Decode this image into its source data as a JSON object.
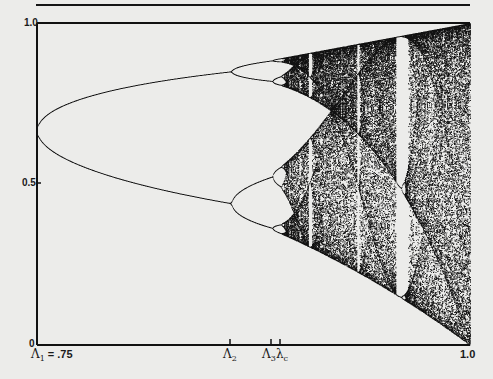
{
  "chart_data": {
    "type": "scatter",
    "title": "",
    "subtitle": "Bifurcation diagram (period-doubling cascade to chaos)",
    "xlabel": "",
    "ylabel": "",
    "xlim": [
      0.75,
      1.0
    ],
    "ylim": [
      0,
      1.0
    ],
    "grid": false,
    "legend": null,
    "y_ticks": [
      {
        "value": 0,
        "label": "0"
      },
      {
        "value": 0.5,
        "label": "0.5"
      },
      {
        "value": 1.0,
        "label": "1.0"
      }
    ],
    "x_ticks": [
      {
        "name": "Lambda_1",
        "symbol": "Λ",
        "sub": "1",
        "suffix": " = .75",
        "value": 0.75
      },
      {
        "name": "Lambda_2",
        "symbol": "Λ",
        "sub": "2",
        "suffix": "",
        "value": 0.862
      },
      {
        "name": "Lambda_3",
        "symbol": "Λ",
        "sub": "3",
        "suffix": "",
        "value": 0.886
      },
      {
        "name": "lambda_c",
        "symbol": "λ",
        "sub": "c",
        "suffix": "",
        "value": 0.8925
      },
      {
        "name": "end",
        "symbol": "",
        "sub": "",
        "suffix": "1.0",
        "value": 1.0
      }
    ],
    "branches": [
      {
        "region": "fixed point",
        "x_range": [
          0.75,
          0.75
        ],
        "y": [
          0.667
        ]
      },
      {
        "region": "period-2",
        "x_range": [
          0.75,
          0.862
        ],
        "y_at_end": [
          0.84,
          0.44
        ]
      },
      {
        "region": "period-4",
        "x_range": [
          0.862,
          0.886
        ],
        "y_at_end": [
          0.87,
          0.75,
          0.53,
          0.38
        ]
      },
      {
        "region": "period-8 onward",
        "x_range": [
          0.886,
          0.8925
        ]
      },
      {
        "region": "chaotic band",
        "x_range": [
          0.8925,
          1.0
        ],
        "y_top_at_end": 1.0,
        "y_bottom_at_end": 0.0
      }
    ],
    "periodic_windows_x": [
      0.905,
      0.925,
      0.935,
      0.95,
      0.96,
      0.9625,
      0.985
    ],
    "notable_window": {
      "name": "period-3 window",
      "x_range": [
        0.955,
        0.962
      ]
    }
  },
  "labels": {
    "y_top": "1.0",
    "y_mid": "0.5",
    "y_bottom": "0",
    "x_lambda1": "Λ",
    "x_lambda1_sub": "1",
    "x_lambda1_suffix": " = .75",
    "x_lambda2": "Λ",
    "x_lambda2_sub": "2",
    "x_lambda3": "Λ",
    "x_lambda3_sub": "3",
    "x_lambdac": "λ",
    "x_lambdac_sub": "c",
    "x_end": "1.0"
  },
  "colors": {
    "paper": "#ececea",
    "ink": "#111111"
  }
}
